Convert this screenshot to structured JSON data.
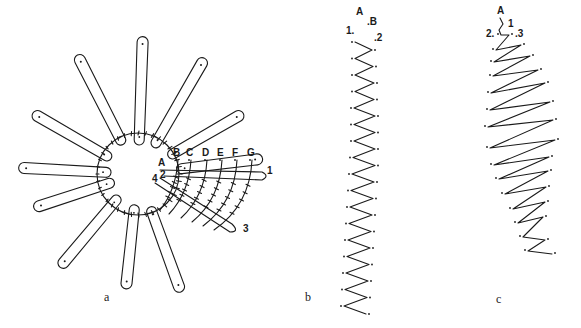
{
  "figure": {
    "panels": [
      {
        "id": "a",
        "caption": "a",
        "caption_pos": [
          104,
          302
        ],
        "description": "Circular wheel with 12 elongated petal loops radiating from central ring; curved stitch rows labeled A–G with numbered points 1–4",
        "center": [
          138,
          174
        ],
        "ring_radius": 41,
        "petals": [
          {
            "angle": -88,
            "inner": 34,
            "outer": 132
          },
          {
            "angle": -60,
            "inner": 36,
            "outer": 128
          },
          {
            "angle": -30,
            "inner": 40,
            "outer": 116
          },
          {
            "angle": -7,
            "inner": 44,
            "outer": 120
          },
          {
            "angle": -117,
            "inner": 38,
            "outer": 128
          },
          {
            "angle": -150,
            "inner": 36,
            "outer": 116
          },
          {
            "angle": -177,
            "inner": 32,
            "outer": 114
          },
          {
            "angle": 162,
            "inner": 30,
            "outer": 104
          },
          {
            "angle": 130,
            "inner": 34,
            "outer": 116
          },
          {
            "angle": 96,
            "inner": 36,
            "outer": 110
          },
          {
            "angle": 70,
            "inner": 40,
            "outer": 120
          }
        ],
        "letters": [
          "A",
          "B",
          "C",
          "D",
          "E",
          "F",
          "G"
        ],
        "letter_positions": [
          [
            161,
            166
          ],
          [
            176,
            156
          ],
          [
            189,
            156
          ],
          [
            205,
            156
          ],
          [
            220,
            156
          ],
          [
            235,
            156
          ],
          [
            250,
            156
          ]
        ],
        "numbers": [
          {
            "label": "1",
            "pos": [
              267,
              174
            ]
          },
          {
            "label": "2",
            "pos": [
              160,
              178
            ]
          },
          {
            "label": "3",
            "pos": [
              243,
              232
            ]
          },
          {
            "label": "4",
            "pos": [
              152,
              182
            ]
          }
        ]
      },
      {
        "id": "b",
        "caption": "b",
        "caption_pos": [
          305,
          302
        ],
        "description": "Vertical narrow zigzag stitch column",
        "labels": [
          {
            "label": "A",
            "pos": [
              356,
              15
            ]
          },
          {
            "label": ".B",
            "pos": [
              367,
              25
            ]
          },
          {
            "label": "1.",
            "pos": [
              346,
              34
            ]
          },
          {
            "label": ".2",
            "pos": [
              374,
              41
            ]
          }
        ],
        "zigzag": {
          "left_x": [
            352,
            352,
            352,
            352,
            351,
            351,
            351,
            350,
            349,
            348,
            347,
            346,
            345,
            344,
            343,
            342,
            341
          ],
          "right_x": [
            375,
            376,
            377,
            377,
            378,
            378,
            378,
            378,
            377,
            376,
            375,
            374,
            373,
            372,
            371,
            370,
            369
          ],
          "top": 38,
          "step": 16.5
        }
      },
      {
        "id": "c",
        "caption": "c",
        "caption_pos": [
          496,
          304
        ],
        "description": "Curved widening-then-narrowing zigzag stitch band",
        "labels": [
          {
            "label": "A",
            "pos": [
              497,
              14
            ]
          },
          {
            "label": "1",
            "pos": [
              508,
              27
            ]
          },
          {
            "label": "2.",
            "pos": [
              486,
              37
            ]
          },
          {
            "label": ".3",
            "pos": [
              515,
              37
            ]
          }
        ],
        "zigzag": {
          "left": [
            [
              498,
              34
            ],
            [
              493,
              49
            ],
            [
              491,
              61
            ],
            [
              490,
              75
            ],
            [
              488,
              92
            ],
            [
              487,
              109
            ],
            [
              485,
              126
            ],
            [
              487,
              147
            ],
            [
              491,
              164
            ],
            [
              496,
              178
            ],
            [
              502,
              193
            ],
            [
              510,
              208
            ],
            [
              515,
              222
            ],
            [
              520,
              236
            ],
            [
              525,
              250
            ]
          ],
          "right": [
            [
              512,
              34
            ],
            [
              524,
              44
            ],
            [
              533,
              55
            ],
            [
              541,
              69
            ],
            [
              548,
              82
            ],
            [
              553,
              101
            ],
            [
              556,
              119
            ],
            [
              558,
              139
            ],
            [
              552,
              156
            ],
            [
              551,
              170
            ],
            [
              549,
              186
            ],
            [
              548,
              201
            ],
            [
              546,
              216
            ],
            [
              548,
              239
            ],
            [
              555,
              253
            ]
          ]
        }
      }
    ]
  }
}
